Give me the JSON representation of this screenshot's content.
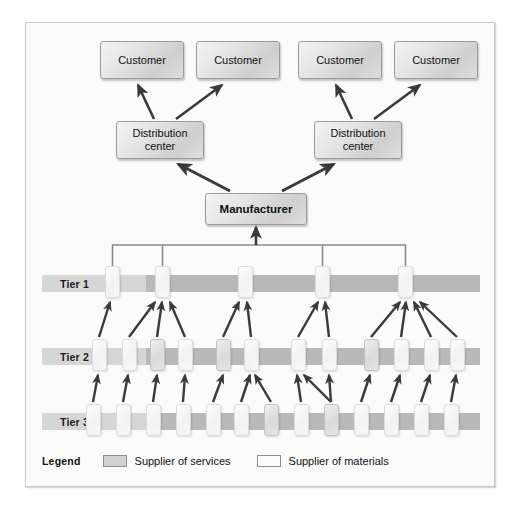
{
  "diagram": {
    "colors": {
      "panel_background": "#fbfbfa",
      "panel_border": "#c9c9c9",
      "tier_bar": "#b9b9b9",
      "tier_label_segment": "#d6d6d6",
      "node_fill": "#e3e3e3",
      "node_border": "#9a9a9a",
      "supplier_services_fill": "#dadada",
      "supplier_materials_fill": "#f7f7f7",
      "arrow": "#3a3a3a",
      "bus_line": "#8a8a8a",
      "text": "#111111"
    }
  },
  "customers": [
    {
      "label": "Customer",
      "x": 74,
      "y": 18,
      "w": 84,
      "h": 38
    },
    {
      "label": "Customer",
      "x": 170,
      "y": 18,
      "w": 84,
      "h": 38
    },
    {
      "label": "Customer",
      "x": 272,
      "y": 18,
      "w": 84,
      "h": 38
    },
    {
      "label": "Customer",
      "x": 368,
      "y": 18,
      "w": 84,
      "h": 38
    }
  ],
  "distribution_centers": [
    {
      "label": "Distribution center",
      "x": 90,
      "y": 98,
      "w": 88,
      "h": 38
    },
    {
      "label": "Distribution center",
      "x": 288,
      "y": 98,
      "w": 88,
      "h": 38
    }
  ],
  "manufacturer": {
    "label": "Manufacturer",
    "x": 179,
    "y": 170,
    "w": 102,
    "h": 32
  },
  "tiers": [
    {
      "label": "Tier 1",
      "row_y": 252,
      "chip_y": 243,
      "chips": [
        {
          "x": 79,
          "type": "materials"
        },
        {
          "x": 129,
          "type": "materials"
        },
        {
          "x": 212,
          "type": "materials"
        },
        {
          "x": 289,
          "type": "materials"
        },
        {
          "x": 372,
          "type": "materials"
        }
      ]
    },
    {
      "label": "Tier 2",
      "row_y": 325,
      "chip_y": 316,
      "chips": [
        {
          "x": 66,
          "type": "materials"
        },
        {
          "x": 96,
          "type": "materials"
        },
        {
          "x": 124,
          "type": "services"
        },
        {
          "x": 152,
          "type": "materials"
        },
        {
          "x": 190,
          "type": "services"
        },
        {
          "x": 218,
          "type": "materials"
        },
        {
          "x": 265,
          "type": "materials"
        },
        {
          "x": 296,
          "type": "materials"
        },
        {
          "x": 338,
          "type": "services"
        },
        {
          "x": 368,
          "type": "materials"
        },
        {
          "x": 398,
          "type": "materials"
        },
        {
          "x": 424,
          "type": "materials"
        }
      ]
    },
    {
      "label": "Tier 3",
      "row_y": 390,
      "chip_y": 381,
      "chips": [
        {
          "x": 60,
          "type": "materials"
        },
        {
          "x": 90,
          "type": "materials"
        },
        {
          "x": 120,
          "type": "materials"
        },
        {
          "x": 150,
          "type": "materials"
        },
        {
          "x": 180,
          "type": "materials"
        },
        {
          "x": 208,
          "type": "materials"
        },
        {
          "x": 238,
          "type": "services"
        },
        {
          "x": 268,
          "type": "materials"
        },
        {
          "x": 298,
          "type": "services"
        },
        {
          "x": 328,
          "type": "materials"
        },
        {
          "x": 358,
          "type": "materials"
        },
        {
          "x": 388,
          "type": "materials"
        },
        {
          "x": 418,
          "type": "materials"
        }
      ]
    }
  ],
  "legend": {
    "title": "Legend",
    "items": [
      {
        "swatch": "services",
        "label": "Supplier of services"
      },
      {
        "swatch": "materials",
        "label": "Supplier of materials"
      }
    ]
  },
  "flows": {
    "dc_to_customers": [
      {
        "from": "dc-1",
        "to": "customer-1"
      },
      {
        "from": "dc-1",
        "to": "customer-2"
      },
      {
        "from": "dc-2",
        "to": "customer-3"
      },
      {
        "from": "dc-2",
        "to": "customer-4"
      }
    ],
    "manufacturer_to_dcs": [
      {
        "from": "manufacturer",
        "to": "dc-1"
      },
      {
        "from": "manufacturer",
        "to": "dc-2"
      }
    ],
    "tier1_bus_to_manufacturer": {
      "from": "tier-1-bus",
      "to": "manufacturer"
    },
    "tier2_to_tier1_count": 16,
    "tier3_to_tier2_count": 15
  }
}
